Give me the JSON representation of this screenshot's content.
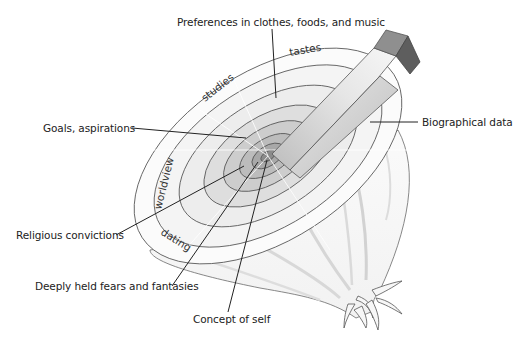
{
  "diagram": {
    "colors": {
      "outline": "#555555",
      "leader_line": "#222222",
      "ring_outer_fill": "#f3f3f3",
      "ring_mid_fill": "#e2e2e2",
      "ring_inner_fill": "#cfcfcf",
      "ring_core_fill": "#a9a9a9",
      "wedge_light": "#efefef",
      "wedge_mid": "#c8c8c8",
      "wedge_dark": "#7a7a7a",
      "text": "#222222"
    },
    "callouts": [
      {
        "id": "preferences",
        "text": "Preferences in clothes, foods, and music"
      },
      {
        "id": "goals",
        "text": "Goals, aspirations"
      },
      {
        "id": "biographical",
        "text": "Biographical data"
      },
      {
        "id": "religious",
        "text": "Religious convictions"
      },
      {
        "id": "fears",
        "text": "Deeply held fears and fantasies"
      },
      {
        "id": "self",
        "text": "Concept of self"
      }
    ],
    "arc_labels": [
      {
        "id": "tastes",
        "text": "tastes"
      },
      {
        "id": "studies",
        "text": "studies"
      },
      {
        "id": "worldview",
        "text": "worldview"
      },
      {
        "id": "dating",
        "text": "dating"
      }
    ]
  }
}
